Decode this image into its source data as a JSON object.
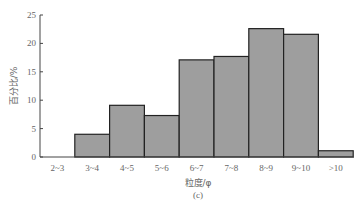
{
  "chart_data": {
    "type": "bar",
    "title": "",
    "caption": "(c)",
    "xlabel": "粒度/φ",
    "ylabel": "百分比/%",
    "categories": [
      "2~3",
      "3~4",
      "4~5",
      "5~6",
      "6~7",
      "7~8",
      "8~9",
      "9~10",
      ">10"
    ],
    "values": [
      0,
      4.0,
      9.1,
      7.3,
      17.1,
      17.7,
      22.6,
      21.6,
      1.1
    ],
    "ylim": [
      0,
      25
    ],
    "yticks": [
      0,
      5,
      10,
      15,
      20,
      25
    ],
    "grid": false,
    "legend": null,
    "bar_color": "#9e9e9e",
    "edge_color": "#222222"
  }
}
